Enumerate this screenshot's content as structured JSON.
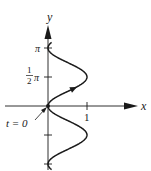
{
  "figure": {
    "axes": {
      "x_label": "x",
      "y_label": "y",
      "x_ticks": [
        {
          "value": 1,
          "label": "1"
        }
      ],
      "y_ticks": [
        {
          "value": 3.14159,
          "label": "π"
        },
        {
          "value": 1.5708,
          "label_num": "1",
          "label_den": "2",
          "label_suffix": "π"
        },
        {
          "value": -1.5708,
          "label": ""
        },
        {
          "value": -3.14159,
          "label": ""
        }
      ]
    },
    "start_annotation": "t = 0",
    "curve": {
      "x_of_t": "sin^2(t)",
      "y_of_t": "t",
      "t_range": [
        -3.45,
        3.45
      ],
      "direction_arrow_t": 0.95
    },
    "colors": {
      "ink": "#1a1a1a",
      "background": "#ffffff"
    }
  }
}
